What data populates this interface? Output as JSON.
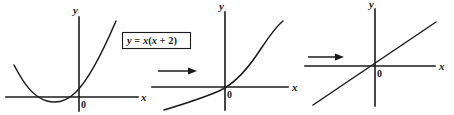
{
  "figure": {
    "kind": "math-graph-sequence",
    "ink_color": "#1a1a1a",
    "background_color": "#ffffff",
    "equation_label": {
      "text": "y = x(x + 2)",
      "parts": {
        "lhs": "y",
        "equals": "=",
        "rhs": "x(x + 2)"
      },
      "boxed": true
    },
    "panels": [
      {
        "id": "panel-1",
        "axis_label_x": "x",
        "axis_label_y": "y",
        "origin_label": "0",
        "curve_type": "parabola",
        "curve_equation": "y = x(x + 2)",
        "roots": [
          -2,
          0
        ],
        "vertex": [
          -1,
          -1
        ],
        "opens": "up",
        "has_incoming_arrow": false
      },
      {
        "id": "panel-2",
        "axis_label_x": "x",
        "axis_label_y": "y",
        "origin_label": "0",
        "curve_type": "increasing-convex",
        "curve_equation": "",
        "roots": [
          0
        ],
        "vertex": null,
        "opens": "",
        "has_incoming_arrow": true
      },
      {
        "id": "panel-3",
        "axis_label_x": "x",
        "axis_label_y": "y",
        "origin_label": "0",
        "curve_type": "straight-line",
        "curve_equation": "",
        "roots": [
          0
        ],
        "vertex": null,
        "opens": "",
        "has_incoming_arrow": true
      }
    ],
    "arrows": [
      {
        "id": "arrow-1",
        "direction": "right"
      },
      {
        "id": "arrow-2",
        "direction": "right"
      }
    ]
  }
}
